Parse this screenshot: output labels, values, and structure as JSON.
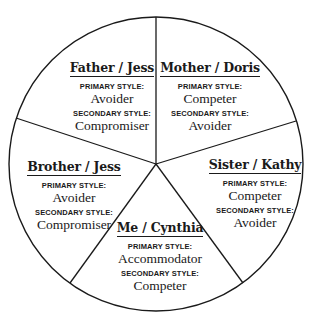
{
  "diagram": {
    "type": "pie-wheel",
    "segments": [
      {
        "name": "Father / Jess",
        "primary_label": "PRIMARY STYLE:",
        "primary": "Avoider",
        "secondary_label": "SECONDARY STYLE:",
        "secondary": "Compromiser"
      },
      {
        "name": "Mother / Doris",
        "primary_label": "PRIMARY STYLE:",
        "primary": "Competer",
        "secondary_label": "SECONDARY STYLE:",
        "secondary": "Avoider"
      },
      {
        "name": "Sister / Kathy",
        "primary_label": "PRIMARY STYLE:",
        "primary": "Competer",
        "secondary_label": "SECONDARY STYLE:",
        "secondary": "Avoider"
      },
      {
        "name": "Me / Cynthia",
        "primary_label": "PRIMARY STYLE:",
        "primary": "Accommodator",
        "secondary_label": "SECONDARY STYLE:",
        "secondary": "Competer"
      },
      {
        "name": "Brother / Jess",
        "primary_label": "PRIMARY STYLE:",
        "primary": "Avoider",
        "secondary_label": "SECONDARY STYLE:",
        "secondary": "Compromiser"
      }
    ],
    "colors": {
      "line": "#1a1a1a",
      "background": "#ffffff"
    }
  }
}
